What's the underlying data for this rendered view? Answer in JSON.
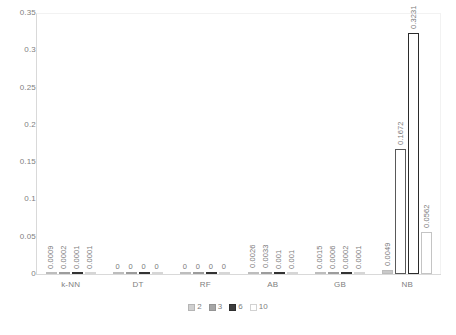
{
  "chart_data": {
    "type": "bar",
    "title": "",
    "xlabel": "",
    "ylabel": "",
    "ylim": [
      0,
      0.35
    ],
    "grid": false,
    "legend_position": "bottom",
    "categories": [
      "k-NN",
      "DT",
      "RF",
      "AB",
      "GB",
      "NB"
    ],
    "ytick_labels": [
      "0.35",
      "0.3",
      "0.25",
      "0.2",
      "0.15",
      "0.1",
      "0.05",
      "0"
    ],
    "ytick_values": [
      0.35,
      0.3,
      0.25,
      0.2,
      0.15,
      0.1,
      0.05,
      0
    ],
    "series": [
      {
        "name": "2",
        "color": "#d0d0d0",
        "values": [
          0.0009,
          0,
          0,
          0.0026,
          0.0015,
          0.0049
        ],
        "labels": [
          "0.0009",
          "0",
          "0",
          "0.0026",
          "0.0015",
          "0.0049"
        ]
      },
      {
        "name": "3",
        "color": "#a6a6a6",
        "values": [
          0.0002,
          0,
          0,
          0.0033,
          0.0006,
          0.1672
        ],
        "labels": [
          "0.0002",
          "0",
          "0",
          "0.0033",
          "0.0006",
          "0.1672"
        ]
      },
      {
        "name": "6",
        "color": "#3d3d3d",
        "values": [
          0.0001,
          0,
          0,
          0.001,
          0.0002,
          0.3231
        ],
        "labels": [
          "0.0001",
          "0",
          "0",
          "0.001",
          "0.0002",
          "0.3231"
        ]
      },
      {
        "name": "10",
        "color": "#ffffff",
        "values": [
          0.0001,
          0,
          0,
          0.001,
          0.0001,
          0.0562
        ],
        "labels": [
          "0.0001",
          "0",
          "0",
          "0.001",
          "0.0001",
          "0.0562"
        ]
      }
    ]
  }
}
